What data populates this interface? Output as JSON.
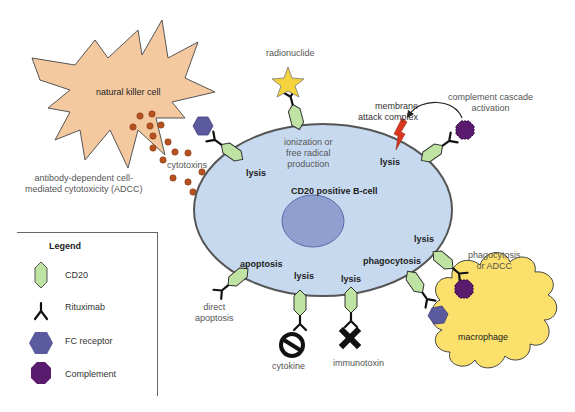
{
  "diagram": {
    "cells": {
      "b_cell": "CD20 positive B-cell",
      "nk_cell": "natural killer cell",
      "macrophage": "macrophage"
    },
    "labels": {
      "radionuclide": "radionuclide",
      "ionization": [
        "ionization or",
        "free radical",
        "production"
      ],
      "membrane_attack": [
        "membrane",
        "attack complex"
      ],
      "complement_cascade": [
        "complement cascade",
        "activation"
      ],
      "cytotoxins": "cytotoxins",
      "adcc": [
        "antibody-dependent cell-",
        "mediated cytotoxicity (ADCC)"
      ],
      "lysis_nk": "lysis",
      "lysis_mac": "lysis",
      "lysis_right": "lysis",
      "lysis_bottom1": "lysis",
      "lysis_bottom2": "lysis",
      "apoptosis": "apoptosis",
      "direct_apoptosis": [
        "direct",
        "apoptosis"
      ],
      "phagocytosis": "phagocytosis",
      "phago_adcc": [
        "phagocytosis",
        "or ADCC"
      ],
      "cytokine": "cytokine",
      "immunotoxin": "immunotoxin"
    },
    "legend": {
      "title": "Legend",
      "items": [
        {
          "icon": "cd20-icon",
          "label": "CD20",
          "color": "#bfe3a3"
        },
        {
          "icon": "rituximab-icon",
          "label": "Rituximab",
          "color": "#111111"
        },
        {
          "icon": "fc-receptor-icon",
          "label": "FC receptor",
          "color": "#5b5a9e"
        },
        {
          "icon": "complement-icon",
          "label": "Complement",
          "color": "#5a1a6e"
        }
      ]
    },
    "colors": {
      "b_cell_fill": "#c6d9ef",
      "nucleus_fill": "#8e9fd0",
      "nk_fill": "#f5c9a0",
      "macrophage_fill": "#fbe06b",
      "cytotoxin_dots": "#b5521f",
      "mac_lightning": "#d9381e",
      "radionuclide_star": "#f5d33c"
    }
  }
}
